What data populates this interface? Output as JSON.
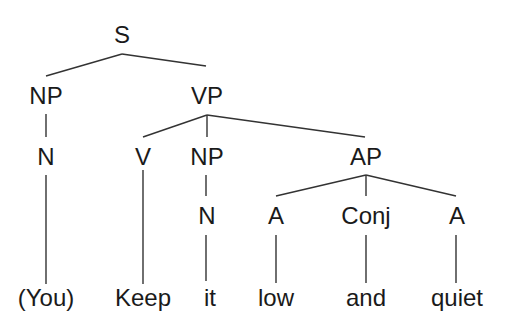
{
  "diagram": {
    "type": "syntax-tree",
    "sentence": "(You) Keep it low and quiet",
    "nodes": {
      "s": "S",
      "np_subj": "NP",
      "vp": "VP",
      "n_subj": "N",
      "v": "V",
      "np_obj": "NP",
      "ap": "AP",
      "n_obj": "N",
      "a1": "A",
      "conj": "Conj",
      "a2": "A"
    },
    "words": {
      "you": "(You)",
      "keep": "Keep",
      "it": "it",
      "low": "low",
      "and": "and",
      "quiet": "quiet"
    },
    "edges": [
      [
        "S",
        "NP"
      ],
      [
        "S",
        "VP"
      ],
      [
        "NP",
        "N"
      ],
      [
        "N",
        "(You)"
      ],
      [
        "VP",
        "V"
      ],
      [
        "VP",
        "NP"
      ],
      [
        "VP",
        "AP"
      ],
      [
        "V",
        "Keep"
      ],
      [
        "NP",
        "N"
      ],
      [
        "N",
        "it"
      ],
      [
        "AP",
        "A"
      ],
      [
        "AP",
        "Conj"
      ],
      [
        "AP",
        "A"
      ],
      [
        "A",
        "low"
      ],
      [
        "Conj",
        "and"
      ],
      [
        "A",
        "quiet"
      ]
    ]
  }
}
